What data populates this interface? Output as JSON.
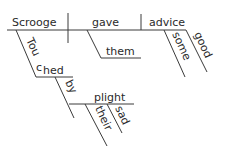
{
  "diagram": {
    "type": "Reed-Kellogg sentence diagram",
    "words": {
      "subject": "Scrooge",
      "verb": "gave",
      "direct_object": "advice",
      "indirect_object": "them",
      "object_modifier_1": "some",
      "object_modifier_2": "good",
      "participle_part1": "Tou",
      "participle_part2": "c",
      "participle_part3": "hed",
      "preposition": "by",
      "prep_object": "plight",
      "prep_object_modifier_1": "their",
      "prep_object_modifier_2": "sad"
    },
    "colors": {
      "line": "#3a3a3a",
      "text": "#2a2a2a",
      "background": "#ffffff"
    }
  }
}
